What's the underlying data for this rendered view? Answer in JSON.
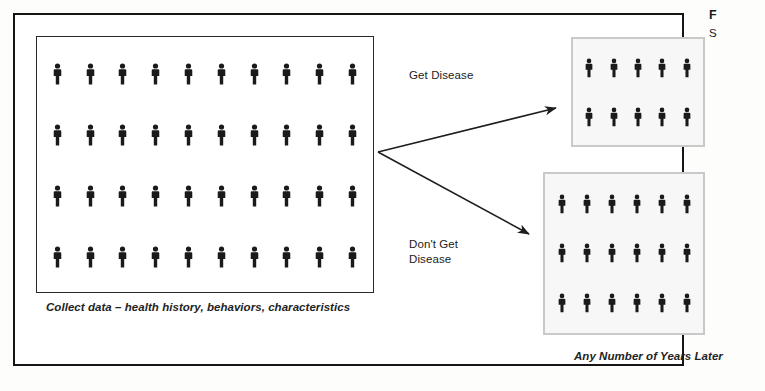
{
  "figure": {
    "type": "cohort-study-diagram",
    "cohort": {
      "caption": "Collect data – health history, behaviors, characteristics",
      "columns": 10,
      "rows": 4,
      "count": 40,
      "icon": "person-icon"
    },
    "branches": [
      {
        "key": "get-disease",
        "label": "Get Disease",
        "direction": "up-right",
        "arrow_icon": "arrow-up-right-icon"
      },
      {
        "key": "dont-get-disease",
        "label": "Don't Get\nDisease",
        "direction": "down-right",
        "arrow_icon": "arrow-down-right-icon"
      }
    ],
    "outcomes": [
      {
        "key": "disease-group",
        "columns": 5,
        "rows": 2,
        "count": 10,
        "icon": "person-icon"
      },
      {
        "key": "no-disease-group",
        "columns": 6,
        "rows": 3,
        "count": 18,
        "icon": "person-icon"
      }
    ],
    "timeline_caption": "Any Number of Years Later",
    "margin_caption": {
      "title": "F",
      "subtitle": "S"
    },
    "colors": {
      "figure_ink": "#151515",
      "cohort_border": "#2a2a2a",
      "outcome_border": "#c9c9c9",
      "outcome_fill": "#f7f7f7",
      "person": "#1a1a1a",
      "page": "#ffffff"
    }
  }
}
